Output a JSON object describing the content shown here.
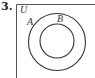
{
  "problem": {
    "number": "3."
  },
  "diagram": {
    "type": "venn",
    "universe_label": "U",
    "sets": [
      {
        "label": "A",
        "relation": "outer"
      },
      {
        "label": "B",
        "relation": "subset of A"
      }
    ],
    "stroke_color": "#333333"
  }
}
